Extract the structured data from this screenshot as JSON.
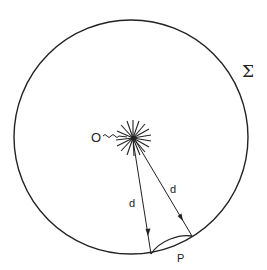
{
  "diagram": {
    "surface_label": "Σ",
    "source_label": "O",
    "patch_label": "P",
    "distance_labels": [
      "d",
      "d"
    ],
    "colors": {
      "stroke": "#222222",
      "background": "#ffffff"
    }
  }
}
